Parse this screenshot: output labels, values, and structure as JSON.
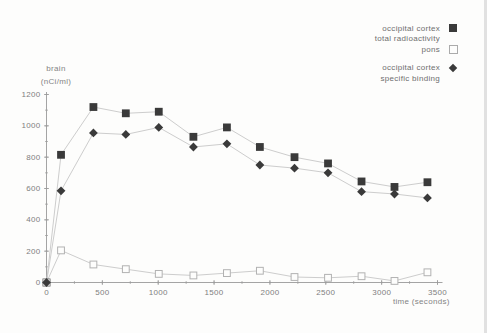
{
  "legend": {
    "rows": [
      {
        "text": "occipital cortex",
        "marker": "filled-square"
      },
      {
        "text": "total radioactivity",
        "marker": "none"
      },
      {
        "text": "pons",
        "marker": "open-square"
      },
      {
        "text": "occipital cortex",
        "marker": "filled-diamond"
      },
      {
        "text": "specific binding",
        "marker": "none"
      }
    ]
  },
  "chart_data": {
    "type": "line",
    "title": "",
    "xlabel": "time (seconds)",
    "ylabel": "brain (nCi/ml)",
    "ylabel_lines": [
      "brain",
      "(nCi/ml)"
    ],
    "x": [
      0,
      130,
      420,
      710,
      1005,
      1315,
      1615,
      1910,
      2220,
      2520,
      2820,
      3115,
      3410
    ],
    "series": [
      {
        "name": "occipital cortex total radioactivity",
        "marker": "filled-square",
        "values": [
          0,
          815,
          1120,
          1080,
          1090,
          930,
          990,
          865,
          800,
          760,
          645,
          610,
          640
        ]
      },
      {
        "name": "pons",
        "marker": "open-square",
        "values": [
          0,
          205,
          115,
          85,
          55,
          45,
          60,
          75,
          35,
          30,
          40,
          10,
          65
        ]
      },
      {
        "name": "occipital cortex specific binding",
        "marker": "filled-diamond",
        "values": [
          0,
          585,
          955,
          945,
          990,
          865,
          885,
          750,
          730,
          700,
          580,
          565,
          540
        ]
      }
    ],
    "xlim": [
      0,
      3500
    ],
    "ylim": [
      0,
      1200
    ],
    "x_ticks": [
      0,
      500,
      1000,
      1500,
      2000,
      2500,
      3000,
      3500
    ],
    "y_ticks": [
      0,
      200,
      400,
      600,
      800,
      1000,
      1200
    ],
    "x_minor_tick_step": 250,
    "y_minor_tick_step": 100,
    "grid": false,
    "legend_position": "top-right",
    "colors": {
      "marker": "#3a3a3a",
      "line": "#cdcdcd",
      "open_marker_fill": "#fdfdfc",
      "open_marker_border": "#b2b2b2",
      "axis": "#9a9a9a",
      "tick_text": "#808080",
      "label_text": "#848484",
      "legend_text": "#6e6e6e"
    }
  }
}
